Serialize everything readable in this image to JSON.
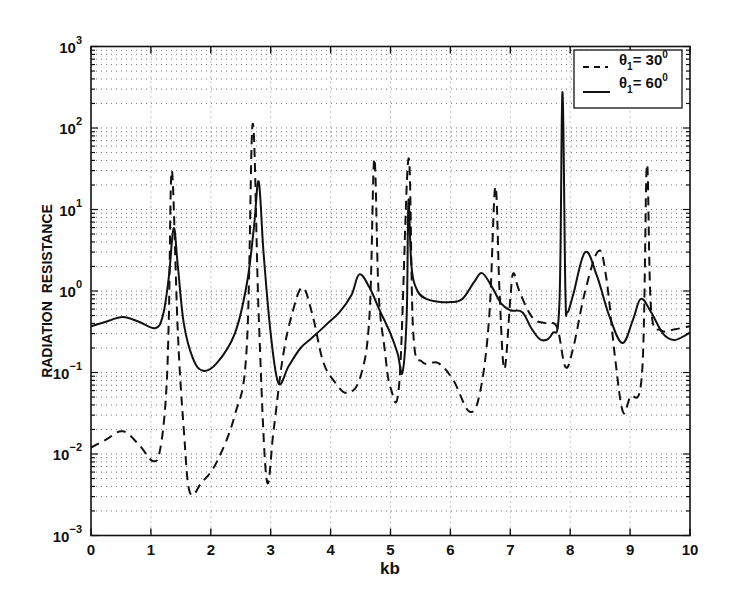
{
  "chart_data": {
    "type": "line",
    "title": "",
    "xlabel": "kb",
    "ylabel": "RADIATION  RESISTANCE",
    "xlim": [
      0,
      10
    ],
    "ylim": [
      0.001,
      1000
    ],
    "yscale": "log",
    "grid": true,
    "legend_position": "upper right",
    "x_ticks": [
      "0",
      "1",
      "2",
      "3",
      "4",
      "5",
      "6",
      "7",
      "8",
      "9",
      "10"
    ],
    "y_ticks": [
      {
        "base": "10",
        "exp": "3"
      },
      {
        "base": "10",
        "exp": "2"
      },
      {
        "base": "10",
        "exp": "1"
      },
      {
        "base": "10",
        "exp": "0"
      },
      {
        "base": "10",
        "exp": "−1"
      },
      {
        "base": "10",
        "exp": "−2"
      },
      {
        "base": "10",
        "exp": "−3"
      }
    ],
    "series": [
      {
        "name": "θ1 = 30°",
        "legend_theta": "θ",
        "legend_sub": "1",
        "legend_eq": "= 30",
        "legend_deg": "0",
        "style": "dashed",
        "x": [
          0.0,
          0.25,
          0.53,
          0.8,
          1.03,
          1.15,
          1.25,
          1.3,
          1.35,
          1.45,
          1.55,
          1.65,
          1.85,
          2.1,
          2.4,
          2.6,
          2.7,
          2.8,
          2.93,
          3.05,
          3.2,
          3.35,
          3.53,
          3.7,
          3.87,
          4.05,
          4.28,
          4.5,
          4.65,
          4.73,
          4.8,
          4.9,
          5.0,
          5.15,
          5.3,
          5.38,
          5.53,
          5.8,
          6.05,
          6.32,
          6.5,
          6.65,
          6.75,
          6.82,
          6.9,
          7.0,
          7.05,
          7.15,
          7.37,
          7.6,
          7.78,
          7.92,
          8.05,
          8.25,
          8.47,
          8.6,
          8.75,
          8.88,
          9.0,
          9.2,
          9.28,
          9.35,
          9.52,
          9.75,
          10.0
        ],
        "y": [
          0.012,
          0.015,
          0.019,
          0.013,
          0.0082,
          0.011,
          0.05,
          0.5,
          30,
          0.3,
          0.02,
          0.0034,
          0.0045,
          0.008,
          0.03,
          0.2,
          112,
          0.5,
          0.005,
          0.02,
          0.15,
          0.5,
          1.1,
          0.5,
          0.14,
          0.08,
          0.056,
          0.09,
          0.5,
          42,
          1.0,
          0.2,
          0.065,
          0.08,
          42,
          0.3,
          0.135,
          0.13,
          0.08,
          0.033,
          0.06,
          0.5,
          19,
          1.0,
          0.11,
          0.8,
          1.65,
          1.0,
          0.47,
          0.4,
          0.36,
          0.117,
          0.2,
          1.0,
          3.1,
          1.5,
          0.15,
          0.033,
          0.05,
          0.1,
          35,
          0.6,
          0.33,
          0.34,
          0.37
        ]
      },
      {
        "name": "θ1 = 60°",
        "legend_theta": "θ",
        "legend_sub": "1",
        "legend_eq": "= 60",
        "legend_deg": "0",
        "style": "solid",
        "x": [
          0.0,
          0.25,
          0.53,
          0.8,
          1.07,
          1.2,
          1.3,
          1.38,
          1.45,
          1.55,
          1.7,
          1.87,
          2.1,
          2.4,
          2.6,
          2.72,
          2.8,
          2.88,
          3.0,
          3.13,
          3.3,
          3.5,
          3.7,
          3.95,
          4.15,
          4.35,
          4.48,
          4.65,
          4.82,
          5.0,
          5.12,
          5.2,
          5.27,
          5.3,
          5.35,
          5.45,
          5.6,
          5.8,
          6.0,
          6.2,
          6.4,
          6.53,
          6.7,
          6.85,
          7.0,
          7.2,
          7.35,
          7.52,
          7.7,
          7.82,
          7.87,
          7.92,
          7.95,
          8.05,
          8.25,
          8.45,
          8.65,
          8.87,
          9.05,
          9.18,
          9.35,
          9.55,
          9.73,
          9.9,
          10.0
        ],
        "y": [
          0.37,
          0.42,
          0.48,
          0.42,
          0.35,
          0.5,
          1.5,
          5.9,
          2.0,
          0.4,
          0.15,
          0.105,
          0.13,
          0.3,
          1.2,
          6,
          22,
          3,
          0.3,
          0.074,
          0.12,
          0.2,
          0.27,
          0.4,
          0.55,
          0.9,
          1.6,
          1.1,
          0.58,
          0.3,
          0.17,
          0.1,
          0.5,
          13,
          2.0,
          1.0,
          0.8,
          0.74,
          0.73,
          0.8,
          1.3,
          1.66,
          1.1,
          0.7,
          0.58,
          0.55,
          0.35,
          0.25,
          0.3,
          0.7,
          275,
          1.0,
          0.55,
          0.9,
          3.0,
          1.5,
          0.5,
          0.23,
          0.45,
          0.8,
          0.55,
          0.3,
          0.25,
          0.28,
          0.31
        ]
      }
    ]
  }
}
